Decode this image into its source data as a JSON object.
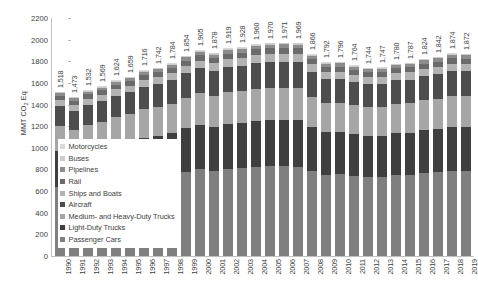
{
  "chart_data": {
    "type": "bar",
    "stacked": true,
    "title": "",
    "xlabel": "",
    "ylabel": "MMT CO2 Eq",
    "ylim": [
      0,
      2200
    ],
    "ytick_step": 200,
    "yticks": [
      0,
      200,
      400,
      600,
      800,
      1000,
      1200,
      1400,
      1600,
      1800,
      2000,
      2200
    ],
    "grid": false,
    "legend_position": "inside-left-middle",
    "categories": [
      "1990",
      "1991",
      "1992",
      "1993",
      "1994",
      "1995",
      "1996",
      "1997",
      "1998",
      "1999",
      "2000",
      "2001",
      "2002",
      "2003",
      "2004",
      "2005",
      "2006",
      "2007",
      "2008",
      "2009",
      "2010",
      "2011",
      "2012",
      "2013",
      "2014",
      "2015",
      "2016",
      "2017",
      "2018",
      "2019"
    ],
    "totals": [
      1518,
      1473,
      1532,
      1569,
      1624,
      1659,
      1716,
      1742,
      1784,
      1854,
      1905,
      1878,
      1919,
      1928,
      1960,
      1970,
      1971,
      1969,
      1866,
      1792,
      1796,
      1764,
      1744,
      1747,
      1780,
      1787,
      1824,
      1842,
      1874,
      1872
    ],
    "total_labels": [
      "1,518",
      "1,473",
      "1,532",
      "1,569",
      "1,624",
      "1,659",
      "1,716",
      "1,742",
      "1,784",
      "1,854",
      "1,905",
      "1,878",
      "1,919",
      "1,928",
      "1,960",
      "1,970",
      "1,971",
      "1,969",
      "1,866",
      "1,792",
      "1,796",
      "1,764",
      "1,744",
      "1,747",
      "1,780",
      "1,787",
      "1,824",
      "1,842",
      "1,874",
      "1,872"
    ],
    "series": [
      {
        "name": "Passenger Cars",
        "color": "#7f7f7f",
        "values": [
          638,
          620,
          645,
          660,
          683,
          697,
          722,
          733,
          750,
          779,
          800,
          789,
          806,
          810,
          824,
          828,
          828,
          827,
          784,
          753,
          755,
          741,
          733,
          734,
          748,
          751,
          767,
          774,
          787,
          787
        ]
      },
      {
        "name": "Light-Duty Trucks",
        "color": "#3f3f3f",
        "values": [
          330,
          320,
          333,
          341,
          353,
          361,
          373,
          379,
          388,
          403,
          414,
          408,
          417,
          419,
          426,
          428,
          429,
          428,
          406,
          390,
          391,
          384,
          379,
          380,
          387,
          389,
          397,
          401,
          408,
          407
        ]
      },
      {
        "name": "Medium- and Heavy-Duty Trucks",
        "color": "#a6a6a6",
        "values": [
          231,
          224,
          233,
          239,
          247,
          252,
          261,
          265,
          271,
          282,
          290,
          286,
          292,
          293,
          298,
          300,
          300,
          300,
          284,
          273,
          273,
          268,
          265,
          266,
          271,
          272,
          277,
          280,
          285,
          285
        ]
      },
      {
        "name": "Aircraft",
        "color": "#4d4d4d",
        "values": [
          186,
          181,
          188,
          192,
          199,
          203,
          210,
          213,
          219,
          227,
          233,
          230,
          235,
          236,
          240,
          241,
          241,
          241,
          229,
          220,
          220,
          216,
          213,
          214,
          218,
          219,
          223,
          226,
          229,
          229
        ]
      },
      {
        "name": "Ships and Boats",
        "color": "#b3b3b3",
        "values": [
          56,
          54,
          56,
          58,
          60,
          61,
          63,
          64,
          66,
          68,
          70,
          69,
          71,
          71,
          72,
          73,
          73,
          73,
          69,
          66,
          66,
          65,
          64,
          64,
          65,
          66,
          67,
          68,
          69,
          69
        ]
      },
      {
        "name": "Rail",
        "color": "#6b6b6b",
        "values": [
          39,
          38,
          40,
          41,
          42,
          43,
          44,
          45,
          46,
          48,
          49,
          48,
          50,
          50,
          51,
          51,
          51,
          51,
          48,
          46,
          46,
          46,
          45,
          45,
          46,
          46,
          47,
          48,
          49,
          49
        ]
      },
      {
        "name": "Pipelines",
        "color": "#8c8c8c",
        "values": [
          26,
          25,
          26,
          27,
          28,
          28,
          29,
          30,
          30,
          32,
          32,
          32,
          33,
          33,
          33,
          34,
          34,
          34,
          32,
          31,
          31,
          30,
          30,
          30,
          30,
          30,
          31,
          31,
          32,
          32
        ]
      },
      {
        "name": "Buses",
        "color": "#cccccc",
        "values": [
          9,
          8,
          9,
          9,
          9,
          9,
          10,
          10,
          10,
          11,
          11,
          11,
          11,
          11,
          11,
          11,
          11,
          11,
          11,
          10,
          10,
          10,
          10,
          10,
          10,
          10,
          10,
          10,
          10,
          10
        ]
      },
      {
        "name": "Motorcycles",
        "color": "#d9d9d9",
        "values": [
          3,
          3,
          3,
          3,
          3,
          4,
          4,
          4,
          4,
          4,
          5,
          5,
          5,
          5,
          5,
          5,
          5,
          5,
          4,
          4,
          4,
          4,
          4,
          4,
          4,
          4,
          4,
          4,
          4,
          4
        ]
      }
    ],
    "legend_order": [
      "Motorcycles",
      "Buses",
      "Pipelines",
      "Rail",
      "Ships and Boats",
      "Aircraft",
      "Medium- and Heavy-Duty Trucks",
      "Light-Duty Trucks",
      "Passenger Cars"
    ]
  },
  "axis": {
    "y_title_main": "MMT CO",
    "y_title_sub": "2",
    "y_title_tail": " Eq"
  }
}
